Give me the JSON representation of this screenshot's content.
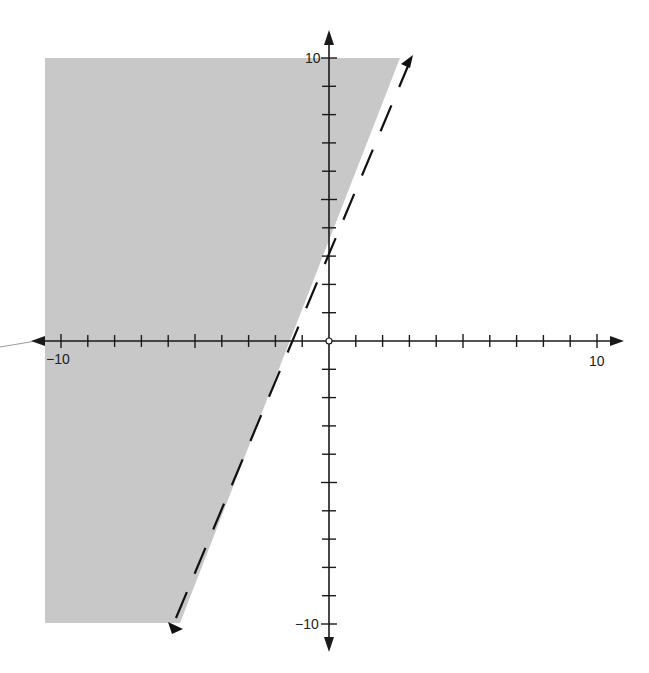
{
  "chart_data": {
    "type": "line",
    "title": "",
    "subtitle": "",
    "xlabel": "",
    "ylabel": "",
    "xlim": [
      -10,
      10
    ],
    "ylim": [
      -10,
      10
    ],
    "grid": false,
    "legend": null,
    "axes": {
      "x_tick_step": 1,
      "y_tick_step": 1,
      "x_tick_labels": [
        {
          "value": -10,
          "label": "−10"
        },
        {
          "value": 10,
          "label": "10"
        }
      ],
      "y_tick_labels": [
        {
          "value": 10,
          "label": "10"
        },
        {
          "value": -10,
          "label": "−10"
        }
      ],
      "origin_marker": "open-circle",
      "arrows": true
    },
    "series": [
      {
        "name": "boundary line",
        "style": "dashed",
        "equation": "y = (9/4)x + 3",
        "slope": 2.25,
        "intercept": 3,
        "x": [
          -5.78,
          3.11
        ],
        "y": [
          -10,
          10
        ],
        "arrows_both_ends": true
      }
    ],
    "shaded_region": {
      "inequality": "y > (9/4)x + 3",
      "side": "left of / above the line",
      "polygon": [
        [
          -10.6,
          10
        ],
        [
          2.65,
          10
        ],
        [
          -5.55,
          -10
        ],
        [
          -10.6,
          -10
        ]
      ],
      "color": "#c8c8c8"
    }
  },
  "labels": {
    "x_neg": "−10",
    "x_pos": "10",
    "y_pos": "10",
    "y_neg": "−10"
  },
  "colors": {
    "shade": "#c8c8c8",
    "axis": "#1a1a1a",
    "line": "#111111",
    "background": "#ffffff"
  }
}
